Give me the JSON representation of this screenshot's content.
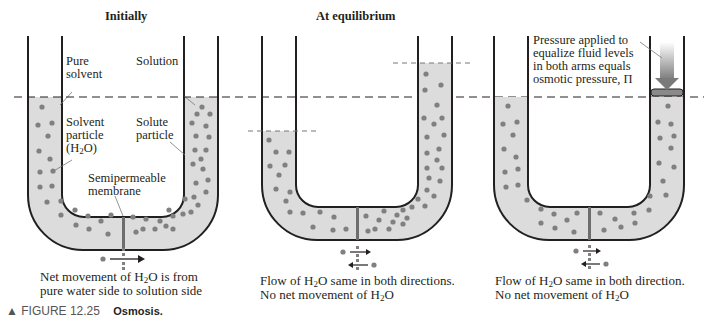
{
  "figure": {
    "number": "FIGURE 12.25",
    "title": "Osmosis.",
    "marker": "▲"
  },
  "panels": [
    {
      "title": "Initially",
      "labels": {
        "pure_solvent_1": "Pure",
        "pure_solvent_2": "solvent",
        "solution": "Solution",
        "solvent_particle_1": "Solvent",
        "solvent_particle_2": "particle",
        "solvent_particle_3_pre": "(H",
        "solvent_particle_3_sub": "2",
        "solvent_particle_3_post": "O)",
        "solute_particle_1": "Solute",
        "solute_particle_2": "particle",
        "membrane_1": "Semipermeable",
        "membrane_2": "membrane"
      },
      "caption_line1_pre": "Net movement of H",
      "caption_line1_sub": "2",
      "caption_line1_post": "O is from",
      "caption_line2": "pure water side to solution side"
    },
    {
      "title": "At equilibrium",
      "caption_line1_pre": "Flow of H",
      "caption_line1_sub": "2",
      "caption_line1_post": "O same in both directions.",
      "caption_line2_pre": "No net movement of H",
      "caption_line2_sub": "2",
      "caption_line2_post": "O"
    },
    {
      "title": "",
      "labels": {
        "pressure_1": "Pressure applied to",
        "pressure_2": "equalize fluid levels",
        "pressure_3": "in both arms equals",
        "pressure_4": "osmotic pressure, Π"
      },
      "caption_line1_pre": "Flow of H",
      "caption_line1_sub": "2",
      "caption_line1_post": "O same in both direction.",
      "caption_line2_pre": "No net movement of H",
      "caption_line2_sub": "2",
      "caption_line2_post": "O"
    }
  ],
  "colors": {
    "tube_outline": "#231f20",
    "solvent_fill": "#dcdcdc",
    "particle": "#808080",
    "membrane": "#6d6d6d",
    "dashed_line": "#231f20",
    "pressure_arrow": "#7a7a7a"
  }
}
